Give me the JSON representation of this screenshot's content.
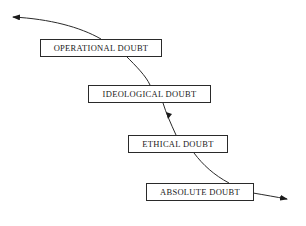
{
  "diagram": {
    "nodes": [
      {
        "id": "operational",
        "label": "OPERATIONAL DOUBT"
      },
      {
        "id": "ideological",
        "label": "IDEOLOGICAL DOUBT"
      },
      {
        "id": "ethical",
        "label": "ETHICAL DOUBT"
      },
      {
        "id": "absolute",
        "label": "ABSOLUTE DOUBT"
      }
    ],
    "edges": [
      {
        "from": "operational",
        "to": "outside-left",
        "arrow": "end"
      },
      {
        "from": "operational",
        "to": "ideological",
        "arrow": "none"
      },
      {
        "from": "ideological",
        "to": "ethical",
        "arrow": "mid"
      },
      {
        "from": "ethical",
        "to": "absolute",
        "arrow": "none"
      },
      {
        "from": "absolute",
        "to": "outside-right",
        "arrow": "end"
      }
    ],
    "colors": {
      "line": "#2a2a2a",
      "background": "#ffffff",
      "text": "#1a1a1a"
    }
  }
}
